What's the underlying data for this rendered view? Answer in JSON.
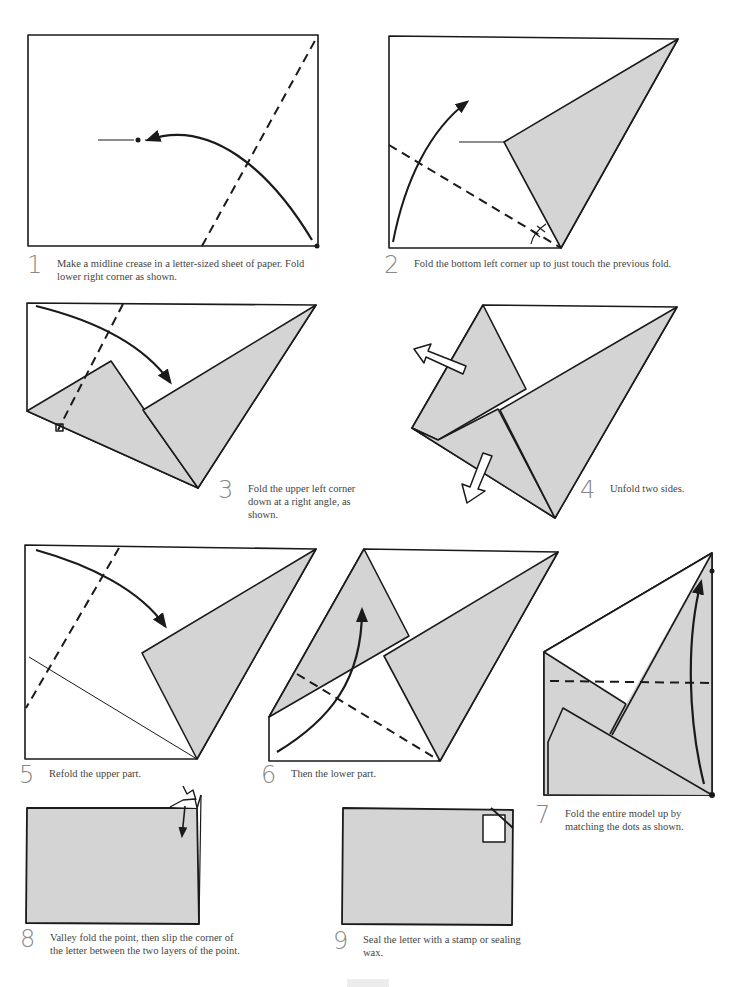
{
  "colors": {
    "paper_fill": "#d4d4d4",
    "line": "#1a1a1a",
    "background": "#ffffff",
    "step_number": "#888888"
  },
  "steps": [
    {
      "number": "1",
      "text": "Make a midline crease in a letter-sized sheet of paper. Fold lower right corner as shown."
    },
    {
      "number": "2",
      "text": "Fold the bottom left corner up to just touch the previous fold."
    },
    {
      "number": "3",
      "text": "Fold the upper left corner down at a right angle, as shown."
    },
    {
      "number": "4",
      "text": "Unfold two sides."
    },
    {
      "number": "5",
      "text": "Refold the upper part."
    },
    {
      "number": "6",
      "text": "Then the lower part."
    },
    {
      "number": "7",
      "text": "Fold the entire model up by matching the dots as shown."
    },
    {
      "number": "8",
      "text": "Valley fold the point, then slip the corner of the letter between the two layers of the point."
    },
    {
      "number": "9",
      "text": "Seal the letter with a stamp or sealing wax."
    }
  ],
  "icons": {
    "fold_arrow": "curved-arrow",
    "unfold_arrow": "hollow-arrow",
    "valley_fold": "dashed-line",
    "dot_marker": "dot",
    "right_angle": "square-mark",
    "stamp": "white-rectangle"
  }
}
